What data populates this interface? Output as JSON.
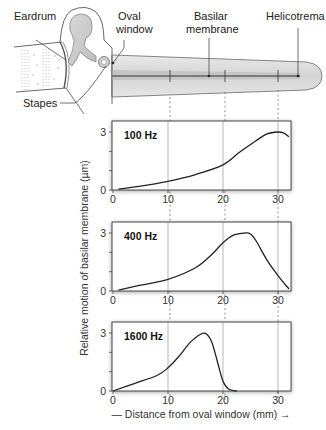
{
  "diagram": {
    "labels": {
      "eardrum": "Eardrum",
      "oval_window_1": "Oval",
      "oval_window_2": "window",
      "basilar_1": "Basilar",
      "basilar_2": "membrane",
      "helicotrema": "Helicotrema",
      "stapes": "Stapes"
    }
  },
  "chart_data": [
    {
      "type": "line",
      "title": "100 Hz",
      "xlabel": "Distance from oval window (mm)",
      "ylabel": "Relative motion of basilar membrane (µm)",
      "xlim": [
        0,
        32
      ],
      "ylim": [
        0,
        3.6
      ],
      "xticks": [
        "0",
        "10",
        "20",
        "30"
      ],
      "yticks": [
        "0",
        "3"
      ],
      "x": [
        1,
        5,
        10,
        15,
        20,
        23,
        26,
        28,
        30,
        31,
        32
      ],
      "y": [
        0.05,
        0.2,
        0.45,
        0.8,
        1.3,
        1.95,
        2.55,
        2.9,
        3.0,
        2.95,
        2.75
      ]
    },
    {
      "type": "line",
      "title": "400 Hz",
      "xlabel": "Distance from oval window (mm)",
      "ylabel": "Relative motion of basilar membrane (µm)",
      "xlim": [
        0,
        32
      ],
      "ylim": [
        0,
        3.6
      ],
      "xticks": [
        "0",
        "10",
        "20",
        "30"
      ],
      "yticks": [
        "0",
        "3"
      ],
      "x": [
        1,
        5,
        10,
        15,
        18,
        20,
        22,
        24,
        25,
        26,
        28,
        30,
        32
      ],
      "y": [
        0.05,
        0.3,
        0.6,
        1.2,
        1.9,
        2.5,
        2.9,
        3.0,
        2.95,
        2.6,
        1.6,
        0.8,
        0.1
      ]
    },
    {
      "type": "line",
      "title": "1600 Hz",
      "xlabel": "Distance from oval window (mm)",
      "ylabel": "Relative motion of basilar membrane (µm)",
      "xlim": [
        0,
        32
      ],
      "ylim": [
        0,
        3.6
      ],
      "xticks": [
        "0",
        "10",
        "20",
        "30"
      ],
      "yticks": [
        "0",
        "3"
      ],
      "x": [
        0,
        4,
        8,
        10,
        12,
        14,
        16,
        17,
        18,
        19,
        20,
        21,
        22.5
      ],
      "y": [
        0,
        0.4,
        0.8,
        1.2,
        1.8,
        2.5,
        2.95,
        2.95,
        2.5,
        1.5,
        0.5,
        0.1,
        0
      ]
    }
  ],
  "axes": {
    "ylabel": "Relative motion of basilar membrane (µm)",
    "xlabel": "— Distance from oval window (mm) →"
  }
}
